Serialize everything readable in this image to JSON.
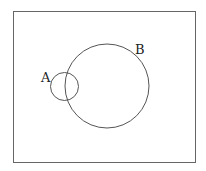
{
  "diagram": {
    "type": "venn",
    "universe": {
      "x": 13.5,
      "y": 11.5,
      "width": 182,
      "height": 151
    },
    "sets": [
      {
        "label": "A",
        "cx": 64.5,
        "cy": 86.5,
        "r": 14,
        "label_x": 41,
        "label_y": 82
      },
      {
        "label": "B",
        "cx": 107,
        "cy": 86,
        "r": 42,
        "label_x": 135,
        "label_y": 54
      }
    ],
    "stroke_color": "#555555"
  }
}
